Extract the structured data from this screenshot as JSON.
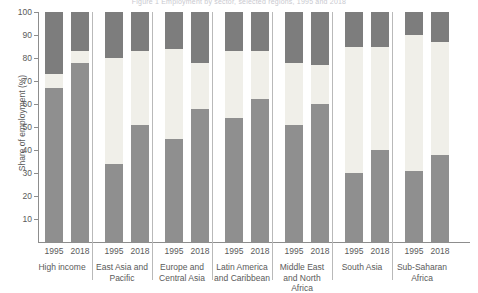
{
  "figure": {
    "top_caption": "Figure 1   Employment by sector, selected regions, 1995 and 2018"
  },
  "chart_data": {
    "type": "bar",
    "subtype": "stacked-column",
    "title": "",
    "xlabel": "",
    "ylabel": "Share of employment (%)",
    "ylim": [
      0,
      100
    ],
    "ytick_step": 10,
    "yticks": [
      "10",
      "20",
      "30",
      "40",
      "50",
      "60",
      "70",
      "80",
      "90",
      "100"
    ],
    "grid": false,
    "legend_position": "none",
    "stack_order_bottom_to_top": [
      "agriculture",
      "industry",
      "services"
    ],
    "series": [
      {
        "name": "agriculture",
        "color": "#8f8f8f"
      },
      {
        "name": "industry",
        "color": "#f0efe9"
      },
      {
        "name": "services",
        "color": "#7d7d7d"
      }
    ],
    "groups": [
      {
        "region": "High income",
        "region_lines": [
          "High income"
        ],
        "bars": [
          {
            "year": "1995",
            "agriculture": 67,
            "industry": 6,
            "services": 27
          },
          {
            "year": "2018",
            "agriculture": 78,
            "industry": 5,
            "services": 17
          }
        ]
      },
      {
        "region": "East Asia and Pacific",
        "region_lines": [
          "East Asia and",
          "Pacific"
        ],
        "bars": [
          {
            "year": "1995",
            "agriculture": 34,
            "industry": 46,
            "services": 20
          },
          {
            "year": "2018",
            "agriculture": 51,
            "industry": 32,
            "services": 17
          }
        ]
      },
      {
        "region": "Europe and Central Asia",
        "region_lines": [
          "Europe and",
          "Central Asia"
        ],
        "bars": [
          {
            "year": "1995",
            "agriculture": 45,
            "industry": 39,
            "services": 16
          },
          {
            "year": "2018",
            "agriculture": 58,
            "industry": 20,
            "services": 22
          }
        ]
      },
      {
        "region": "Latin America and Caribbean",
        "region_lines": [
          "Latin America",
          "and Caribbean"
        ],
        "bars": [
          {
            "year": "1995",
            "agriculture": 54,
            "industry": 29,
            "services": 17
          },
          {
            "year": "2018",
            "agriculture": 62,
            "industry": 21,
            "services": 17
          }
        ]
      },
      {
        "region": "Middle East and North Africa",
        "region_lines": [
          "Middle East",
          "and North Africa"
        ],
        "bars": [
          {
            "year": "1995",
            "agriculture": 51,
            "industry": 27,
            "services": 22
          },
          {
            "year": "2018",
            "agriculture": 60,
            "industry": 17,
            "services": 23
          }
        ]
      },
      {
        "region": "South Asia",
        "region_lines": [
          "South Asia"
        ],
        "bars": [
          {
            "year": "1995",
            "agriculture": 30,
            "industry": 55,
            "services": 15
          },
          {
            "year": "2018",
            "agriculture": 40,
            "industry": 45,
            "services": 15
          }
        ]
      },
      {
        "region": "Sub-Saharan Africa",
        "region_lines": [
          "Sub-Saharan",
          "Africa"
        ],
        "bars": [
          {
            "year": "1995",
            "agriculture": 31,
            "industry": 59,
            "services": 10
          },
          {
            "year": "2018",
            "agriculture": 38,
            "industry": 49,
            "services": 13
          }
        ]
      }
    ]
  }
}
